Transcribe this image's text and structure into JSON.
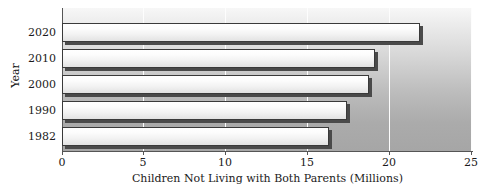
{
  "chart_data": {
    "type": "bar",
    "orientation": "horizontal",
    "title": "",
    "xlabel": "Children Not Living with Both Parents (Millions)",
    "ylabel": "Year",
    "categories": [
      "2020",
      "2010",
      "2000",
      "1990",
      "1982"
    ],
    "values": [
      21.8,
      19.1,
      18.7,
      17.4,
      16.3
    ],
    "series": [
      {
        "name": "Children Not Living with Both Parents (Millions)",
        "values": [
          21.8,
          19.1,
          18.7,
          17.4,
          16.3
        ]
      }
    ],
    "xlim": [
      0,
      25
    ],
    "xticks": [
      0,
      5,
      10,
      15,
      20,
      25
    ],
    "xtick_labels": [
      "0",
      "5",
      "10",
      "15",
      "20",
      "25"
    ],
    "ytick_labels": [
      "2020",
      "2010",
      "2000",
      "1990",
      "1982"
    ],
    "grid": "vertical-white-gridlines",
    "legend": "none",
    "bar_style": "3d-shadow",
    "colors": {
      "bar_fill_light": "#ffffff",
      "bar_fill_dark": "#e2e2e2",
      "bar_outline": "#3a3a3a",
      "bar_shadow": "#4a4a4a",
      "plot_bg_top": "#f7f7f7",
      "plot_bg_bottom": "#a6a6a6",
      "gridline": "#fdfdfd",
      "axis": "#555555",
      "text": "#1a1a1a"
    }
  }
}
